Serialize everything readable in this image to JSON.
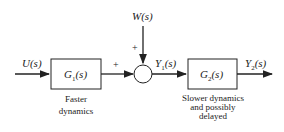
{
  "diagram": {
    "type": "block-diagram",
    "blocks": [
      {
        "id": "g1",
        "label": "G1(s)",
        "label_main": "G",
        "label_sub": "1",
        "label_arg": "(s)",
        "caption_lines": [
          "Faster",
          "dynamics"
        ]
      },
      {
        "id": "g2",
        "label": "G2(s)",
        "label_main": "G",
        "label_sub": "2",
        "label_arg": "(s)",
        "caption_lines": [
          "Slower dynamics",
          "and possibly",
          "delayed"
        ]
      }
    ],
    "signals": {
      "input": {
        "main": "U",
        "arg": "(s)"
      },
      "disturbance": {
        "main": "W",
        "arg": "(s)"
      },
      "intermediate": {
        "main": "Y",
        "sub": "1",
        "arg": "(s)"
      },
      "output": {
        "main": "Y",
        "sub": "2",
        "arg": "(s)"
      }
    },
    "summing_junction": {
      "signs": [
        "+",
        "+"
      ]
    },
    "line_color": "#222222"
  }
}
